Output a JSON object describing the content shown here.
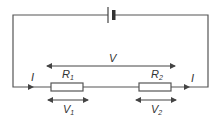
{
  "diagram": {
    "type": "series circuit",
    "battery": {
      "label": ""
    },
    "current_left": "I",
    "current_right": "I",
    "resistors": [
      {
        "name": "R",
        "sub": "1"
      },
      {
        "name": "R",
        "sub": "2"
      }
    ],
    "total_voltage": "V",
    "voltages": [
      {
        "name": "V",
        "sub": "1"
      },
      {
        "name": "V",
        "sub": "2"
      }
    ],
    "colors": {
      "wire": "#555555",
      "text": "#333333",
      "fill": "#ffffff"
    }
  }
}
